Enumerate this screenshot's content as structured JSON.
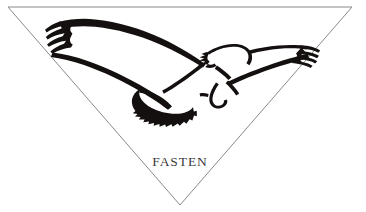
{
  "image": {
    "kind": "logo-mark",
    "width": 366,
    "height": 212,
    "background_color": "#ffffff",
    "alt_description": "Eagle in flight inside an inverted triangle above the word FASTEN"
  },
  "logo": {
    "brand_name": "FASTEN",
    "wordmark_color": "#3b3b3b",
    "emblem_name": "flying-eagle",
    "emblem_color": "#14100f",
    "frame": {
      "shape": "inverted-triangle",
      "stroke_color": "#8a8a8a",
      "stroke_width": "1px",
      "fill_color": "#ffffff",
      "points": "8,7 352,7 180,205"
    }
  }
}
